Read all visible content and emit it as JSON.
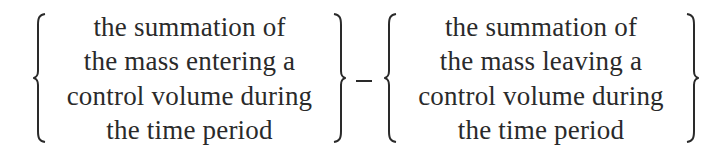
{
  "equation": {
    "left_term": {
      "lines": [
        "the summation of",
        "the mass entering a",
        "control volume during",
        "the time period"
      ]
    },
    "operator": "−",
    "right_term": {
      "lines": [
        "the summation of",
        "the mass leaving a",
        "control volume during",
        "the time period"
      ]
    }
  }
}
